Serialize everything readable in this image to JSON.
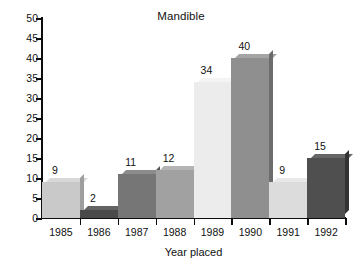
{
  "chart_data": {
    "type": "bar",
    "title": "Mandible",
    "xlabel": "Year placed",
    "ylabel": "",
    "categories": [
      "1985",
      "1986",
      "1987",
      "1988",
      "1989",
      "1990",
      "1991",
      "1992"
    ],
    "values": [
      9,
      2,
      11,
      12,
      34,
      40,
      9,
      15
    ],
    "value_labels": [
      "9",
      "2",
      "11",
      "12",
      "34",
      "40",
      "9",
      "15"
    ],
    "ylim": [
      0,
      50
    ],
    "yticks": [
      0,
      5,
      10,
      15,
      20,
      25,
      30,
      35,
      40,
      45,
      50
    ],
    "ytick_labels": [
      "0",
      "5",
      "10",
      "15",
      "20",
      "25",
      "30",
      "35",
      "40",
      "45",
      "50"
    ],
    "grid": false,
    "legend": "none",
    "bar_colors": [
      "#c9c9c9",
      "#4a4a4a",
      "#767676",
      "#a1a1a1",
      "#ececec",
      "#8f8f8f",
      "#dcdcdc",
      "#4f4f4f"
    ],
    "bar_top_colors": [
      "#d8d8d8",
      "#636363",
      "#8c8c8c",
      "#b4b4b4",
      "#f4f4f4",
      "#a5a5a5",
      "#e8e8e8",
      "#666666"
    ],
    "bar_side_colors": [
      "#9e9e9e",
      "#2e2e2e",
      "#565656",
      "#7d7d7d",
      "#c7c7c7",
      "#6c6c6c",
      "#b2b2b2",
      "#333333"
    ],
    "axis_color": "#0d0d0d",
    "background_color": "#ffffff"
  }
}
